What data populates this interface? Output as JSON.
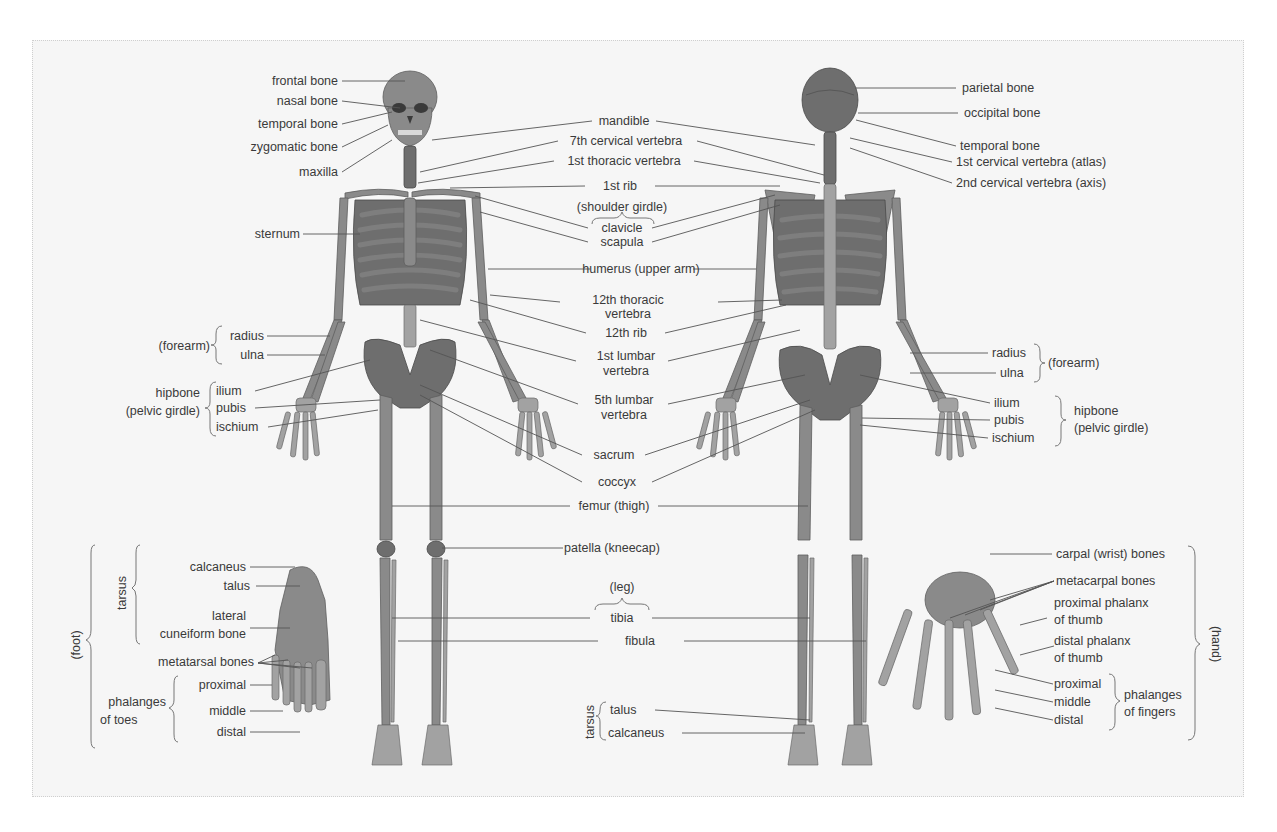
{
  "figure": {
    "colors": {
      "background": "#f6f6f6",
      "bone": "#8a8a8a",
      "bone_dark": "#6e6e6e",
      "text": "#3a3a3a",
      "leader": "#555555"
    }
  },
  "anterior": {
    "skull": {
      "frontal": "frontal bone",
      "nasal": "nasal bone",
      "temporal": "temporal bone",
      "zygomatic": "zygomatic bone",
      "maxilla": "maxilla"
    },
    "sternum": "sternum",
    "forearm": {
      "group": "(forearm)",
      "radius": "radius",
      "ulna": "ulna"
    },
    "hipbone": {
      "group_line1": "hipbone",
      "group_line2": "(pelvic girdle)",
      "ilium": "ilium",
      "pubis": "pubis",
      "ischium": "ischium"
    }
  },
  "center": {
    "mandible": "mandible",
    "c7": "7th cervical vertebra",
    "t1": "1st thoracic vertebra",
    "rib1": "1st rib",
    "shoulder_girdle": "(shoulder girdle)",
    "clavicle": "clavicle",
    "scapula": "scapula",
    "humerus": "humerus (upper arm)",
    "t12_line1": "12th thoracic",
    "t12_line2": "vertebra",
    "rib12": "12th rib",
    "l1_line1": "1st lumbar",
    "l1_line2": "vertebra",
    "l5_line1": "5th lumbar",
    "l5_line2": "vertebra",
    "sacrum": "sacrum",
    "coccyx": "coccyx",
    "femur": "femur (thigh)",
    "patella": "patella (kneecap)",
    "leg": "(leg)",
    "tibia": "tibia",
    "fibula": "fibula"
  },
  "posterior": {
    "parietal": "parietal bone",
    "occipital": "occipital bone",
    "temporal": "temporal bone",
    "atlas": "1st cervical vertebra (atlas)",
    "axis": "2nd cervical vertebra (axis)",
    "forearm": {
      "radius": "radius",
      "ulna": "ulna",
      "group": "(forearm)"
    },
    "hipbone": {
      "ilium": "ilium",
      "pubis": "pubis",
      "ischium": "ischium",
      "group_line1": "hipbone",
      "group_line2": "(pelvic girdle)"
    },
    "tarsus": {
      "group": "tarsus",
      "talus": "talus",
      "calcaneus": "calcaneus"
    }
  },
  "foot": {
    "group": "(foot)",
    "tarsus": "tarsus",
    "calcaneus": "calcaneus",
    "talus": "talus",
    "lateral_line1": "lateral",
    "lateral_line2": "cuneiform bone",
    "metatarsal": "metatarsal bones",
    "phalanges_line1": "phalanges",
    "phalanges_line2": "of toes",
    "proximal": "proximal",
    "middle": "middle",
    "distal": "distal"
  },
  "hand": {
    "group": "(hand)",
    "carpal": "carpal (wrist) bones",
    "metacarpal": "metacarpal bones",
    "prox_thumb_line1": "proximal phalanx",
    "prox_thumb_line2": "of thumb",
    "dist_thumb_line1": "distal phalanx",
    "dist_thumb_line2": "of thumb",
    "proximal": "proximal",
    "middle": "middle",
    "distal": "distal",
    "phalanges_line1": "phalanges",
    "phalanges_line2": "of fingers"
  }
}
